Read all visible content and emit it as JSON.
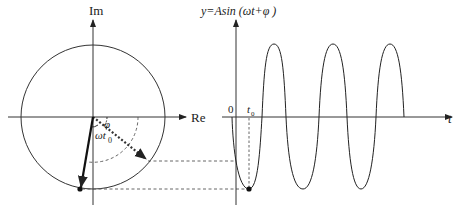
{
  "diagram": {
    "phasor": {
      "imag_axis_label": "Im",
      "real_axis_label": "Re",
      "phase_angle_label": "φ",
      "rotation_angle_label": "ωt",
      "rotation_angle_subscript": "0"
    },
    "waveform": {
      "equation_label": "y=Asin (ωt+φ )",
      "time_axis_label": "t",
      "origin_label": "0",
      "t0_label": "t",
      "t0_subscript": "0"
    },
    "colors": {
      "line": "#222222",
      "background": "#ffffff"
    }
  }
}
